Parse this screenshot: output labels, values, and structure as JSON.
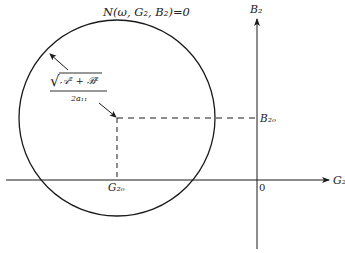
{
  "diagram": {
    "title": "N(ω, G₂, B₂)=0",
    "axes": {
      "x_label": "G₂",
      "y_label": "B₂",
      "origin_label": "0"
    },
    "center": {
      "x_label": "G₂ₒ",
      "y_label": "B₂ₒ"
    },
    "radius_label": {
      "numerator": "√𝒜² + ℬ²",
      "numerator_sqrt": "√",
      "numerator_body": "𝒜² + ℬ²",
      "denominator": "2a₁₁"
    },
    "colors": {
      "line": "#1a1a1a",
      "background": "#ffffff"
    }
  }
}
